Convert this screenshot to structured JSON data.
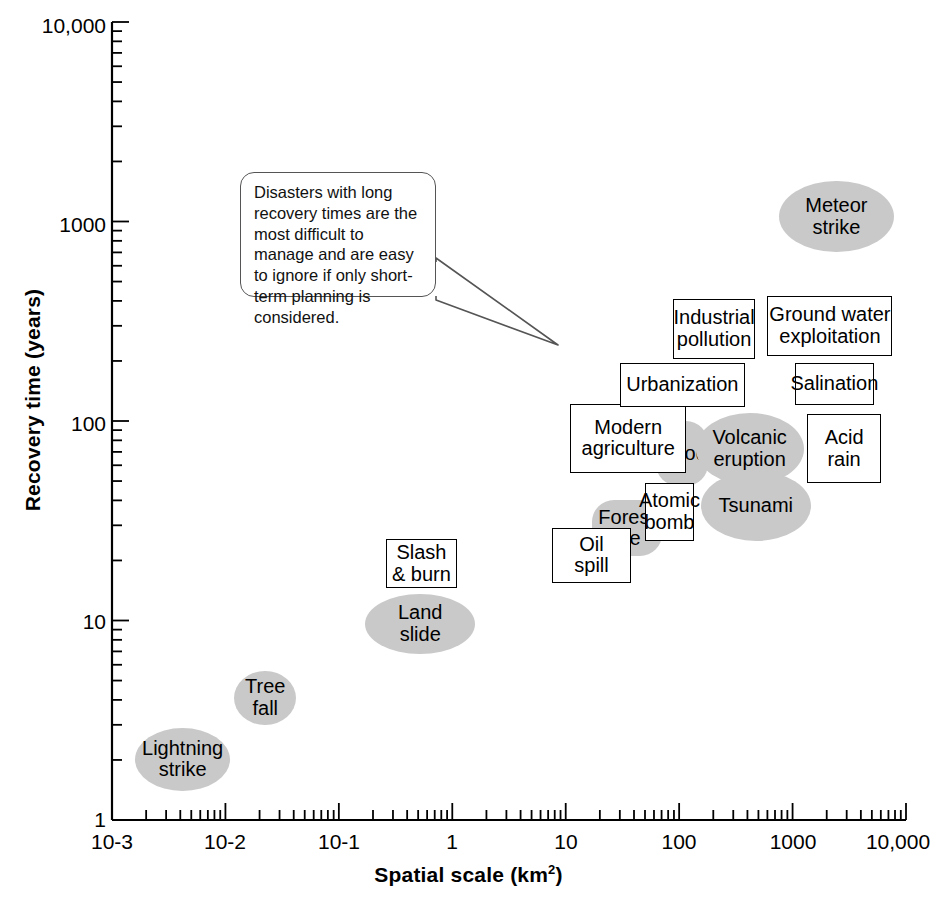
{
  "chart_data": {
    "type": "scatter",
    "title": "",
    "xlabel": "Spatial scale (km2)",
    "xlabel_base": "Spatial scale (km",
    "xlabel_sup": "2",
    "xlabel_tail": ")",
    "ylabel": "Recovery time (years)",
    "xscale": "log",
    "yscale": "log",
    "xlim": [
      0.001,
      10000
    ],
    "ylim": [
      1,
      10000
    ],
    "grid": false,
    "legend": "none",
    "xticks": [
      "10-3",
      "10-2",
      "10-1",
      "1",
      "10",
      "100",
      "1000",
      "10,000"
    ],
    "xtick_values": [
      0.001,
      0.01,
      0.1,
      1,
      10,
      100,
      1000,
      10000
    ],
    "yticks": [
      "1",
      "10",
      "100",
      "1000",
      "10,000"
    ],
    "ytick_values": [
      1,
      10,
      100,
      1000,
      10000
    ],
    "minor_ticks": true,
    "shape_legend": {
      "ellipse": "natural disaster (shaded ellipse)",
      "box": "human-induced disaster (open rectangle)",
      "rounded": "shaded rounded rectangle"
    },
    "colors": {
      "shaded_fill": "#c9c9c9",
      "box_fill": "#ffffff",
      "stroke": "#000000",
      "text": "#000000",
      "callout_stroke": "#555555"
    },
    "points": [
      {
        "label": "Lightning strike",
        "lines": [
          "Lightning",
          "strike"
        ],
        "shape": "ellipse",
        "x": 0.004,
        "y": 2.0,
        "x_range": [
          0.0016,
          0.011
        ],
        "y_range": [
          1.4,
          2.9
        ]
      },
      {
        "label": "Tree fall",
        "lines": [
          "Tree",
          "fall"
        ],
        "shape": "ellipse",
        "x": 0.022,
        "y": 4.1,
        "x_range": [
          0.012,
          0.042
        ],
        "y_range": [
          3.0,
          5.6
        ]
      },
      {
        "label": "Land slide",
        "lines": [
          "Land",
          "slide"
        ],
        "shape": "ellipse",
        "x": 0.47,
        "y": 9.6,
        "x_range": [
          0.17,
          1.6
        ],
        "y_range": [
          6.8,
          13.6
        ]
      },
      {
        "label": "Slash & burn",
        "lines": [
          "Slash",
          "& burn"
        ],
        "shape": "box",
        "x": 0.6,
        "y": 19.0,
        "x_range": [
          0.26,
          1.1
        ],
        "y_range": [
          14.5,
          25.5
        ]
      },
      {
        "label": "Oil spill",
        "lines": [
          "Oil",
          "spill"
        ],
        "shape": "box",
        "x": 16.0,
        "y": 21.0,
        "x_range": [
          7.5,
          38.0
        ],
        "y_range": [
          15.5,
          29.0
        ]
      },
      {
        "label": "Forest fire",
        "lines": [
          "Forest",
          "fire"
        ],
        "shape": "rounded",
        "x": 34.0,
        "y": 29.0,
        "x_range": [
          17.0,
          70.0
        ],
        "y_range": [
          21.0,
          40.0
        ]
      },
      {
        "label": "Atomic bomb",
        "lines": [
          "Atomic",
          "bomb"
        ],
        "shape": "box",
        "x": 80.0,
        "y": 35.0,
        "x_range": [
          50.0,
          135.0
        ],
        "y_range": [
          25.0,
          49.0
        ]
      },
      {
        "label": "Modern agriculture",
        "lines": [
          "Modern",
          "agriculture"
        ],
        "shape": "box",
        "x": 36.0,
        "y": 82.0,
        "x_range": [
          11.0,
          115.0
        ],
        "y_range": [
          55.0,
          122.0
        ]
      },
      {
        "label": "Flood",
        "lines": [
          "Flood"
        ],
        "shape": "rounded",
        "x": 105.0,
        "y": 68.0,
        "x_range": [
          62.0,
          180.0
        ],
        "y_range": [
          47.0,
          100.0
        ]
      },
      {
        "label": "Volcanic eruption",
        "lines": [
          "Volcanic",
          "eruption"
        ],
        "shape": "ellipse",
        "x": 420.0,
        "y": 72.0,
        "x_range": [
          140.0,
          1250.0
        ],
        "y_range": [
          48.0,
          110.0
        ]
      },
      {
        "label": "Tsunami",
        "lines": [
          "Tsunami"
        ],
        "shape": "ellipse",
        "x": 480.0,
        "y": 37.0,
        "x_range": [
          155.0,
          1450.0
        ],
        "y_range": [
          25.0,
          56.0
        ]
      },
      {
        "label": "Acid rain",
        "lines": [
          "Acid",
          "rain"
        ],
        "shape": "box",
        "x": 2800.0,
        "y": 72.0,
        "x_range": [
          1350.0,
          6000.0
        ],
        "y_range": [
          49.0,
          108.0
        ]
      },
      {
        "label": "Urbanization",
        "lines": [
          "Urbanization"
        ],
        "shape": "box",
        "x": 105.0,
        "y": 150.0,
        "x_range": [
          30.0,
          380.0
        ],
        "y_range": [
          118.0,
          195.0
        ]
      },
      {
        "label": "Salination",
        "lines": [
          "Salination"
        ],
        "shape": "box",
        "x": 2300.0,
        "y": 152.0,
        "x_range": [
          1050.0,
          5200.0
        ],
        "y_range": [
          120.0,
          196.0
        ]
      },
      {
        "label": "Industrial pollution",
        "lines": [
          "Industrial",
          "pollution"
        ],
        "shape": "box",
        "x": 200.0,
        "y": 290.0,
        "x_range": [
          88.0,
          470.0
        ],
        "y_range": [
          205.0,
          410.0
        ]
      },
      {
        "label": "Ground water exploitation",
        "lines": [
          "Ground water",
          "exploitation"
        ],
        "shape": "box",
        "x": 2100.0,
        "y": 300.0,
        "x_range": [
          600.0,
          7600.0
        ],
        "y_range": [
          212.0,
          425.0
        ]
      },
      {
        "label": "Meteor strike",
        "lines": [
          "Meteor",
          "strike"
        ],
        "shape": "ellipse",
        "x": 2400.0,
        "y": 1050.0,
        "x_range": [
          760.0,
          7800.0
        ],
        "y_range": [
          700.0,
          1600.0
        ]
      }
    ],
    "annotations": [
      {
        "id": "callout",
        "text": "Disasters with long recovery times are the most difficult to manage and are easy to ignore if only short-term planning is considered.",
        "lines": [
          "Disasters with long",
          "recovery times are the",
          "most difficult to manage",
          "and are easy to ignore if",
          "only short-term planning",
          "is considered."
        ],
        "shape": "speech-bubble",
        "points_to_x": 60.0,
        "points_to_y": 330.0
      }
    ]
  }
}
